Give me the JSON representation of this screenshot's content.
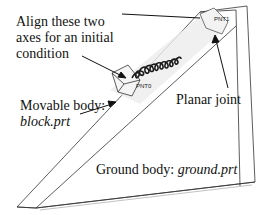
{
  "annotations": {
    "align_axes": [
      "Align these two",
      "axes for an initial",
      "condition"
    ],
    "movable_body": {
      "prefix": "Movable body:",
      "file": "block.prt"
    },
    "planar_joint": "Planar joint",
    "ground_body": {
      "prefix": "Ground body: ",
      "file": "ground.prt"
    }
  },
  "points": {
    "pnt0": "PNT0",
    "pnt1": "PNT1"
  },
  "colors": {
    "line": "#222222",
    "spring": "#1a1a1a",
    "shade": "#d9d9d9",
    "background": "#ffffff"
  }
}
